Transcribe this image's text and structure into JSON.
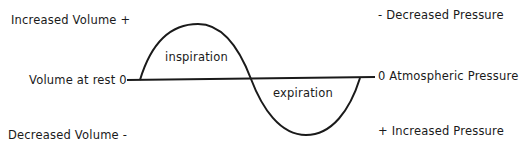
{
  "left_axis": {
    "top": "Increased Volume +",
    "middle": "Volume at rest 0",
    "bottom": "Decreased Volume -"
  },
  "right_axis": {
    "top": "- Decreased Pressure",
    "middle": "0 Atmospheric Pressure",
    "bottom": "+ Increased Pressure"
  },
  "curve_labels": {
    "upper": "inspiration",
    "lower": "expiration"
  },
  "colors": {
    "line": "#1a1a1a",
    "background": "#ffffff"
  }
}
